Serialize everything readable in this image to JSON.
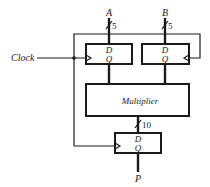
{
  "diagram": {
    "type": "block-diagram",
    "inputs": [
      {
        "name": "A",
        "width": "5"
      },
      {
        "name": "B",
        "width": "5"
      }
    ],
    "clock_label": "Clock",
    "register_a": {
      "d_label": "D",
      "q_label": "Q"
    },
    "register_b": {
      "d_label": "D",
      "q_label": "Q"
    },
    "multiplier_label": "Multiplier",
    "product_bus_width": "10",
    "register_p": {
      "d_label": "D",
      "q_label": "Q"
    },
    "output": {
      "name": "P"
    },
    "colors": {
      "ink": "#1a1a1a",
      "background": "#ffffff"
    }
  }
}
